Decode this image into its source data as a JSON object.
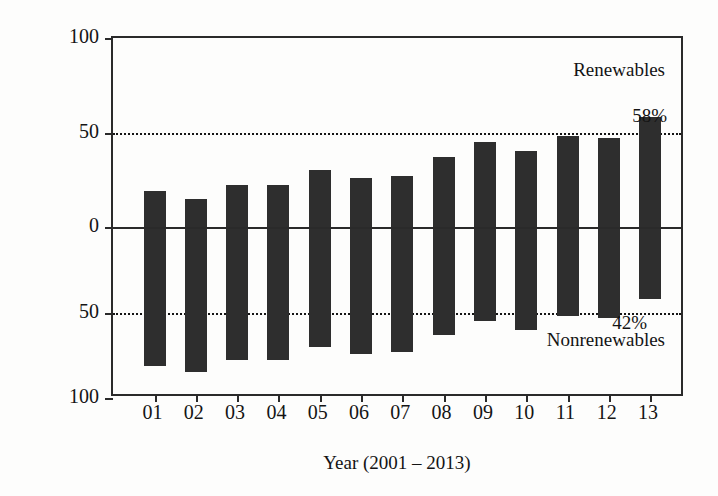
{
  "chart_data": {
    "type": "bar",
    "title": "",
    "subtitle": "",
    "xlabel": "Year (2001 – 2013)",
    "ylabel": "Share in global net capacity additions (%)",
    "categories": [
      "01",
      "02",
      "03",
      "04",
      "05",
      "06",
      "07",
      "08",
      "09",
      "10",
      "11",
      "12",
      "13"
    ],
    "series": [
      {
        "name": "Renewables",
        "values": [
          19,
          15,
          22,
          22,
          30,
          26,
          27,
          37,
          45,
          40,
          48,
          47,
          58
        ]
      },
      {
        "name": "Nonrenewables",
        "values": [
          81,
          85,
          78,
          78,
          70,
          74,
          73,
          63,
          55,
          60,
          52,
          53,
          42
        ]
      }
    ],
    "ylim": [
      -100,
      100
    ],
    "y_ticks": [
      {
        "value": 100,
        "label": "100"
      },
      {
        "value": 50,
        "label": "50"
      },
      {
        "value": 0,
        "label": "0"
      },
      {
        "value": -50,
        "label": "50"
      },
      {
        "value": -100,
        "label": "100"
      }
    ],
    "reference_lines": [
      {
        "value": 50,
        "style": "dotted"
      },
      {
        "value": -50,
        "style": "dotted"
      }
    ],
    "grid": false,
    "legend_position": "inside-right",
    "annotations": [
      {
        "name": "renewables-label",
        "text": "Renewables"
      },
      {
        "name": "nonrenewables-label",
        "text": "Nonrenewables"
      },
      {
        "name": "top-value-label",
        "text": "58%"
      },
      {
        "name": "bottom-value-label",
        "text": "42%"
      }
    ],
    "colors": {
      "bar": "#2e2e2e",
      "axis": "#2a2a2a",
      "text": "#141414",
      "background": "#fdfdfc"
    }
  }
}
